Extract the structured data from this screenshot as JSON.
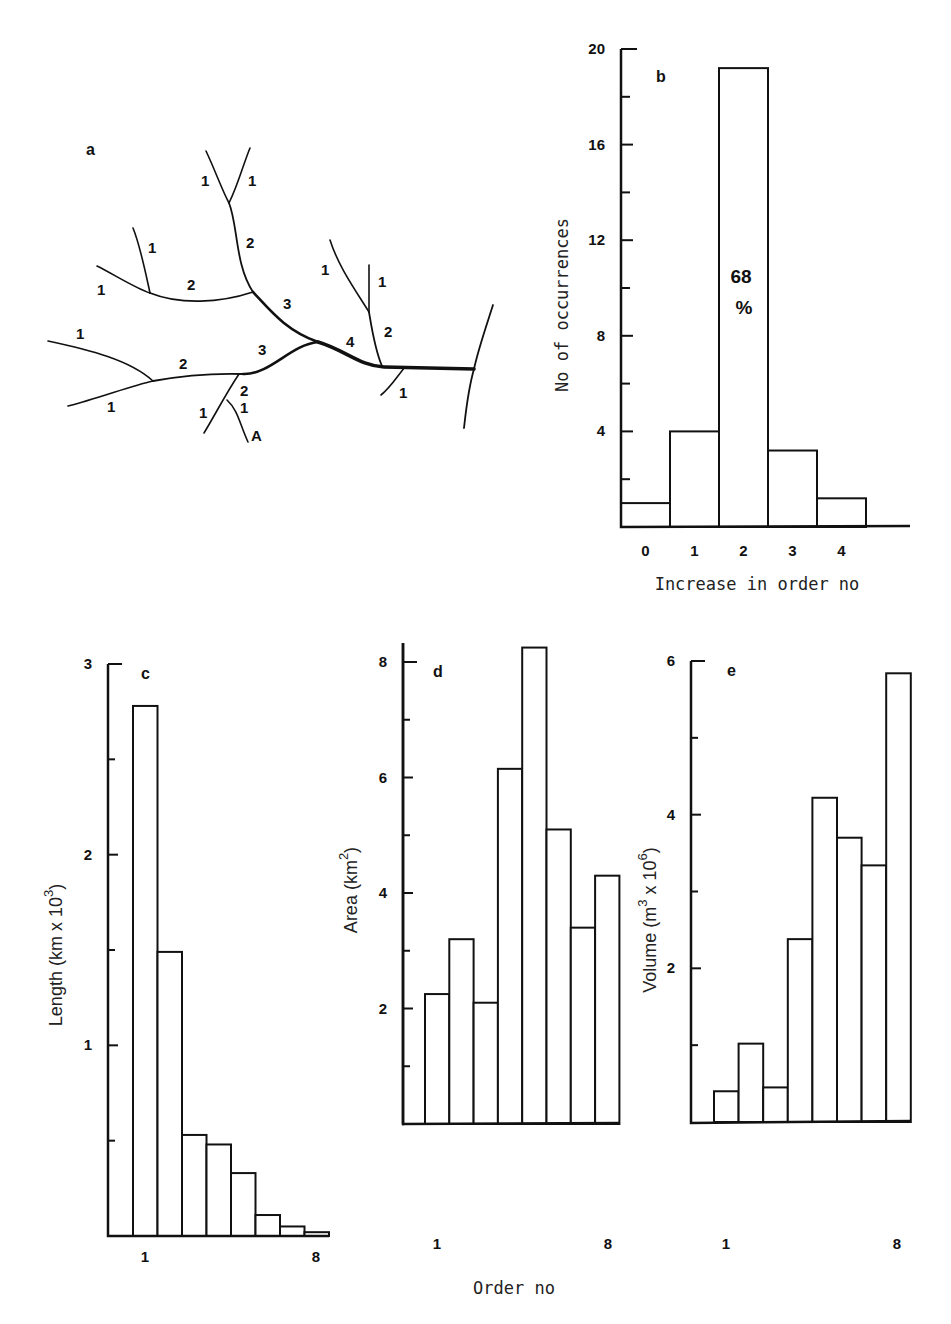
{
  "panel_a": {
    "letter": "a",
    "outlet_label": "A",
    "order_labels": [
      {
        "t": "1",
        "x": 205,
        "y": 185
      },
      {
        "t": "1",
        "x": 252,
        "y": 185
      },
      {
        "t": "2",
        "x": 250,
        "y": 248
      },
      {
        "t": "1",
        "x": 152,
        "y": 253
      },
      {
        "t": "1",
        "x": 101,
        "y": 295
      },
      {
        "t": "2",
        "x": 192,
        "y": 292
      },
      {
        "t": "3",
        "x": 288,
        "y": 310
      },
      {
        "t": "1",
        "x": 325,
        "y": 276
      },
      {
        "t": "1",
        "x": 382,
        "y": 287
      },
      {
        "t": "2",
        "x": 388,
        "y": 337
      },
      {
        "t": "4",
        "x": 350,
        "y": 346
      },
      {
        "t": "1",
        "x": 80,
        "y": 340
      },
      {
        "t": "2",
        "x": 183,
        "y": 370
      },
      {
        "t": "3",
        "x": 263,
        "y": 355
      },
      {
        "t": "2",
        "x": 245,
        "y": 395
      },
      {
        "t": "1",
        "x": 111,
        "y": 412
      },
      {
        "t": "1",
        "x": 203,
        "y": 418
      },
      {
        "t": "1",
        "x": 245,
        "y": 414
      },
      {
        "t": "1",
        "x": 403,
        "y": 397
      }
    ]
  },
  "chart_data": [
    {
      "id": "b",
      "type": "bar",
      "panel_letter": "b",
      "title": "",
      "xlabel": "Increase in order no",
      "ylabel": "No of occurrences",
      "categories": [
        "0",
        "1",
        "2",
        "3",
        "4"
      ],
      "values": [
        1,
        4,
        19.2,
        3.2,
        1.2
      ],
      "ylim": [
        0,
        20
      ],
      "yticks_labeled": [
        "4",
        "8",
        "12",
        "16",
        "20"
      ],
      "annotation": {
        "line1": "68",
        "line2": "%",
        "on_category": "2"
      },
      "grid": false
    },
    {
      "id": "c",
      "type": "bar",
      "panel_letter": "c",
      "xlabel": "Order no",
      "ylabel": "Length (km x 10³)",
      "categories": [
        "1",
        "2",
        "3",
        "4",
        "5",
        "6",
        "7",
        "8"
      ],
      "values": [
        2.78,
        1.49,
        0.53,
        0.48,
        0.33,
        0.11,
        0.05,
        0.02
      ],
      "ylim": [
        0,
        3
      ],
      "yticks_labeled": [
        "1",
        "2",
        "3"
      ],
      "xticks_labeled": [
        "1",
        "8"
      ],
      "grid": false
    },
    {
      "id": "d",
      "type": "bar",
      "panel_letter": "d",
      "xlabel": "Order no",
      "ylabel": "Area (km²)",
      "categories": [
        "1",
        "2",
        "3",
        "4",
        "5",
        "6",
        "7",
        "8"
      ],
      "values": [
        2.25,
        3.2,
        2.1,
        6.15,
        8.25,
        5.1,
        3.4,
        4.3
      ],
      "ylim": [
        0,
        8
      ],
      "yticks_labeled": [
        "2",
        "4",
        "6",
        "8"
      ],
      "xticks_labeled": [
        "1",
        "8"
      ],
      "grid": false
    },
    {
      "id": "e",
      "type": "bar",
      "panel_letter": "e",
      "xlabel": "Order no",
      "ylabel": "Volume (m³ x 10⁶)",
      "categories": [
        "1",
        "2",
        "3",
        "4",
        "5",
        "6",
        "7",
        "8"
      ],
      "values": [
        0.4,
        1.02,
        0.45,
        2.38,
        4.22,
        3.7,
        3.34,
        5.84
      ],
      "ylim": [
        0,
        6
      ],
      "yticks_labeled": [
        "2",
        "4",
        "6"
      ],
      "xticks_labeled": [
        "1",
        "8"
      ],
      "grid": false
    }
  ],
  "labels": {
    "b_xlabel": "Increase in order no",
    "b_ylabel": "No of occurrences",
    "c_ylabel_main": "Length (km x 10",
    "c_ylabel_sup": "3",
    "c_ylabel_end": ")",
    "d_ylabel_main": "Area (km",
    "d_ylabel_sup": "2",
    "d_ylabel_end": ")",
    "e_ylabel_main": "Volume (m",
    "e_ylabel_sup": "3",
    "e_ylabel_mid": " x 10",
    "e_ylabel_sup2": "6",
    "e_ylabel_end": ")",
    "shared_xlabel": "Order no",
    "b_annot_1": "68",
    "b_annot_2": "%"
  }
}
